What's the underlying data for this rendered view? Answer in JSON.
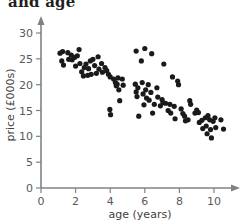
{
  "chart_data": {
    "type": "scatter",
    "title": "and age",
    "xlabel": "age (years)",
    "ylabel": "price (£000s)",
    "xlim": [
      0,
      11.4
    ],
    "ylim": [
      0,
      31.5
    ],
    "xticks": [
      0,
      2,
      4,
      6,
      8,
      10
    ],
    "yticks": [
      0,
      5,
      10,
      15,
      20,
      25,
      30
    ],
    "xtick_labels": [
      "0",
      "2",
      "4",
      "6",
      "8",
      "10"
    ],
    "ytick_labels": [
      "0",
      "5",
      "10",
      "15",
      "20",
      "25",
      "30"
    ],
    "grid": false,
    "legend": null,
    "marker_color": "#1a1a1a",
    "marker_size": 2.6,
    "n_points": 101,
    "points": [
      [
        1.1,
        26.1
      ],
      [
        1.25,
        26.4
      ],
      [
        1.2,
        24.6
      ],
      [
        1.3,
        23.8
      ],
      [
        1.55,
        26.2
      ],
      [
        1.6,
        24.9
      ],
      [
        1.75,
        25.7
      ],
      [
        1.8,
        24.8
      ],
      [
        1.95,
        25.3
      ],
      [
        2.0,
        23.6
      ],
      [
        2.1,
        25.6
      ],
      [
        2.2,
        26.8
      ],
      [
        2.25,
        24.1
      ],
      [
        2.35,
        22.5
      ],
      [
        2.45,
        21.7
      ],
      [
        2.5,
        23.3
      ],
      [
        2.6,
        24.0
      ],
      [
        2.7,
        21.8
      ],
      [
        2.75,
        23.1
      ],
      [
        2.85,
        24.6
      ],
      [
        2.9,
        22.0
      ],
      [
        3.0,
        24.9
      ],
      [
        3.1,
        23.7
      ],
      [
        3.2,
        22.2
      ],
      [
        3.3,
        25.4
      ],
      [
        3.35,
        23.0
      ],
      [
        3.5,
        24.1
      ],
      [
        3.55,
        22.4
      ],
      [
        3.7,
        23.3
      ],
      [
        3.8,
        22.7
      ],
      [
        3.9,
        22.0
      ],
      [
        4.0,
        21.5
      ],
      [
        3.98,
        15.2
      ],
      [
        4.02,
        14.2
      ],
      [
        4.2,
        21.1
      ],
      [
        4.3,
        20.4
      ],
      [
        4.35,
        19.8
      ],
      [
        4.45,
        21.3
      ],
      [
        4.4,
        20.1
      ],
      [
        4.5,
        19.0
      ],
      [
        4.55,
        16.9
      ],
      [
        4.7,
        21.1
      ],
      [
        4.75,
        19.9
      ],
      [
        5.45,
        20.1
      ],
      [
        5.5,
        26.5
      ],
      [
        5.5,
        18.6
      ],
      [
        5.55,
        17.7
      ],
      [
        5.6,
        19.4
      ],
      [
        5.65,
        13.9
      ],
      [
        5.8,
        24.6
      ],
      [
        5.85,
        20.4
      ],
      [
        5.9,
        18.2
      ],
      [
        5.95,
        16.1
      ],
      [
        6.0,
        27.0
      ],
      [
        6.05,
        19.0
      ],
      [
        6.1,
        17.4
      ],
      [
        6.2,
        20.0
      ],
      [
        6.25,
        17.0
      ],
      [
        6.35,
        18.5
      ],
      [
        6.4,
        26.0
      ],
      [
        6.45,
        14.5
      ],
      [
        6.55,
        16.2
      ],
      [
        6.7,
        19.4
      ],
      [
        6.75,
        17.6
      ],
      [
        6.9,
        15.9
      ],
      [
        7.0,
        17.1
      ],
      [
        7.05,
        16.5
      ],
      [
        7.1,
        24.0
      ],
      [
        7.2,
        16.4
      ],
      [
        7.35,
        15.0
      ],
      [
        7.45,
        16.2
      ],
      [
        7.5,
        14.5
      ],
      [
        7.6,
        21.5
      ],
      [
        7.7,
        15.8
      ],
      [
        7.75,
        13.4
      ],
      [
        7.9,
        20.7
      ],
      [
        7.95,
        20.0
      ],
      [
        8.1,
        15.3
      ],
      [
        8.2,
        14.4
      ],
      [
        8.3,
        13.9
      ],
      [
        8.35,
        13.0
      ],
      [
        8.5,
        13.2
      ],
      [
        8.6,
        16.9
      ],
      [
        8.65,
        16.2
      ],
      [
        8.9,
        14.5
      ],
      [
        9.0,
        15.1
      ],
      [
        9.1,
        14.6
      ],
      [
        9.15,
        12.7
      ],
      [
        9.3,
        13.1
      ],
      [
        9.35,
        11.5
      ],
      [
        9.5,
        13.6
      ],
      [
        9.55,
        12.0
      ],
      [
        9.6,
        10.5
      ],
      [
        9.65,
        14.0
      ],
      [
        9.75,
        13.2
      ],
      [
        9.8,
        11.3
      ],
      [
        9.85,
        9.7
      ],
      [
        9.95,
        12.9
      ],
      [
        10.05,
        13.6
      ],
      [
        10.1,
        11.7
      ],
      [
        10.4,
        13.2
      ],
      [
        10.55,
        11.4
      ]
    ]
  }
}
